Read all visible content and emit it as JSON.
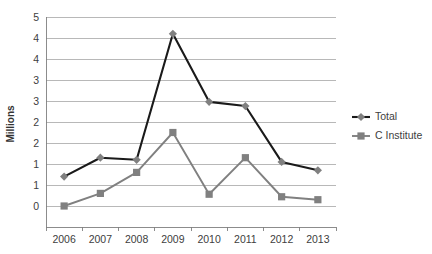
{
  "chart_data": {
    "type": "line",
    "title": "",
    "xlabel": "",
    "ylabel": "Millions",
    "categories": [
      "2006",
      "2007",
      "2008",
      "2009",
      "2010",
      "2011",
      "2012",
      "2013"
    ],
    "series": [
      {
        "name": "Total",
        "marker": "diamond",
        "color": "#1a1a1a",
        "marker_color": "#808080",
        "values": [
          1.2,
          1.65,
          1.6,
          4.6,
          2.98,
          2.88,
          1.55,
          1.35
        ]
      },
      {
        "name": "C Institute",
        "marker": "square",
        "color": "#808080",
        "marker_color": "#808080",
        "values": [
          0.5,
          0.8,
          1.3,
          2.25,
          0.78,
          1.65,
          0.72,
          0.65
        ]
      }
    ],
    "ylim": [
      0,
      5
    ],
    "yticks": [
      0,
      0.5,
      1,
      1.5,
      2,
      2.5,
      3,
      3.5,
      4,
      4.5,
      5
    ],
    "ytick_labels": [
      "0",
      "1",
      "1",
      "2",
      "2",
      "3",
      "3",
      "4",
      "4",
      "5"
    ],
    "grid": true,
    "legend_position": "right"
  },
  "legend": {
    "entries": [
      {
        "label": "Total"
      },
      {
        "label": "C Institute"
      }
    ]
  },
  "axes": {
    "y_title": "Millions"
  }
}
